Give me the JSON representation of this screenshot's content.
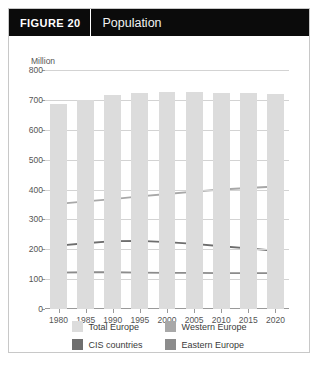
{
  "figure": {
    "tag": "FIGURE  20",
    "title": "Population"
  },
  "colors": {
    "header_background": "#0b0b0b",
    "header_text": "#ffffff",
    "card_border": "#c8c8c8",
    "total_europe": "#dcdcdc",
    "western_europe": "#a8a8a8",
    "cis_countries": "#6e6e6e",
    "eastern_europe": "#8c8c8c",
    "gridline": "#d3d3d3",
    "axis": "#9a9a9a",
    "tick_text": "#555555"
  },
  "chart_data": {
    "type": "bar",
    "title": "Population",
    "xlabel": "",
    "ylabel": "Million",
    "ylim": [
      0,
      800
    ],
    "ytick_values": [
      0,
      100,
      200,
      300,
      400,
      500,
      600,
      700,
      800
    ],
    "ytick_labels": [
      "0",
      "100",
      "200",
      "300",
      "400",
      "500",
      "600",
      "700",
      "800"
    ],
    "grid": true,
    "legend_position": "bottom",
    "categories": [
      "1980",
      "1985",
      "1990",
      "1995",
      "2000",
      "2005",
      "2010",
      "2015",
      "2020"
    ],
    "series": [
      {
        "name": "Total Europe",
        "render": "bar",
        "color": "#dcdcdc",
        "values": [
          685,
          700,
          718,
          722,
          726,
          728,
          724,
          722,
          720
        ]
      },
      {
        "name": "Western Europe",
        "render": "line",
        "color": "#a8a8a8",
        "values": [
          352,
          360,
          368,
          377,
          385,
          393,
          400,
          405,
          410
        ]
      },
      {
        "name": "CIS countries",
        "render": "line",
        "color": "#6e6e6e",
        "values": [
          212,
          220,
          227,
          228,
          224,
          218,
          210,
          203,
          195
        ]
      },
      {
        "name": "Eastern Europe",
        "render": "line",
        "color": "#8c8c8c",
        "values": [
          122,
          123,
          123,
          122,
          121,
          121,
          120,
          120,
          120
        ]
      }
    ]
  },
  "legend": {
    "items": [
      {
        "label": "Total Europe",
        "color": "#dcdcdc"
      },
      {
        "label": "Western Europe",
        "color": "#a8a8a8"
      },
      {
        "label": "CIS countries",
        "color": "#6e6e6e"
      },
      {
        "label": "Eastern Europe",
        "color": "#8c8c8c"
      }
    ]
  }
}
